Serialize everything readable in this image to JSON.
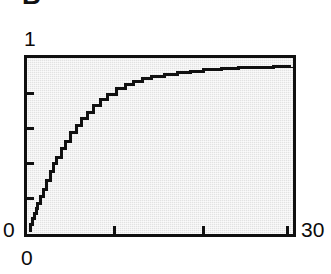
{
  "figure": {
    "panel_letter": "B",
    "background_color": "#ffffff",
    "panel_color": "#ececec",
    "ink_color": "#101010"
  },
  "axes": {
    "y_max_label": "1",
    "y_min_label": "0",
    "x_min_label": "0",
    "x_max_label": "30"
  },
  "chart_data": {
    "type": "line",
    "title": "B",
    "xlabel": "",
    "ylabel": "",
    "xlim": [
      0,
      30
    ],
    "ylim": [
      0,
      1
    ],
    "grid": false,
    "legend": null,
    "x_tick_labels": [
      "0",
      "30"
    ],
    "y_tick_labels": [
      "0",
      "1"
    ],
    "x_ticks_unlabeled": [
      10,
      20
    ],
    "y_ticks_unlabeled": [
      0.2,
      0.4,
      0.6,
      0.8
    ],
    "line_color": "#101010",
    "line_width": 3,
    "step_like": true,
    "series": [
      {
        "name": "cumulative",
        "x": [
          0,
          0.2,
          0.4,
          0.6,
          0.8,
          1.0,
          1.3,
          1.6,
          2.0,
          2.4,
          2.8,
          3.2,
          3.7,
          4.2,
          4.8,
          5.4,
          6.0,
          6.7,
          7.4,
          8.2,
          9.0,
          10.0,
          11.0,
          12.0,
          13.0,
          14.0,
          15.5,
          17.0,
          18.5,
          20.0,
          22.0,
          24.0,
          26.0,
          28.0,
          30.0
        ],
        "y": [
          0.0,
          0.035,
          0.07,
          0.1,
          0.13,
          0.16,
          0.205,
          0.245,
          0.3,
          0.35,
          0.4,
          0.44,
          0.49,
          0.535,
          0.585,
          0.63,
          0.67,
          0.71,
          0.75,
          0.785,
          0.815,
          0.85,
          0.875,
          0.895,
          0.91,
          0.925,
          0.94,
          0.95,
          0.957,
          0.965,
          0.972,
          0.977,
          0.98,
          0.983,
          0.985
        ]
      }
    ]
  }
}
